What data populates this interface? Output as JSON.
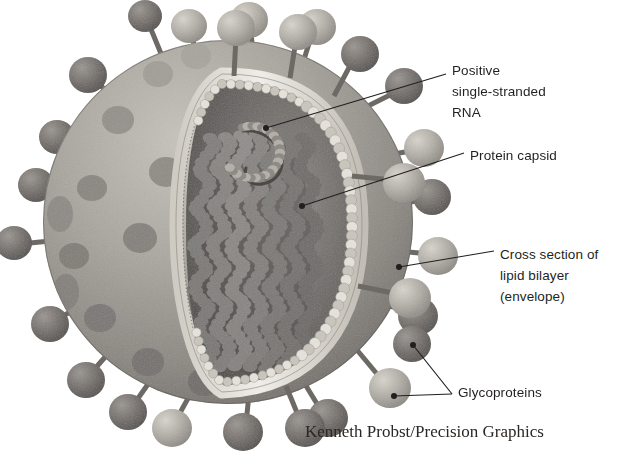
{
  "figure": {
    "credit": "Kenneth Probst/Precision Graphics",
    "background_color": "#ffffff",
    "ink_color": "#231f20"
  },
  "labels": [
    {
      "id": "rna",
      "text": "Positive\nsingle-stranded\nRNA",
      "lines": [
        "Positive",
        "single-stranded",
        "RNA"
      ],
      "text_x": 452,
      "text_y": 60,
      "leader": {
        "from_x": 266,
        "from_y": 128,
        "to_x": 446,
        "to_y": 74,
        "dot": true
      }
    },
    {
      "id": "protein-capsid",
      "text": "Protein capsid",
      "lines": [
        "Protein capsid"
      ],
      "text_x": 470,
      "text_y": 145,
      "leader": {
        "from_x": 302,
        "from_y": 206,
        "to_x": 464,
        "to_y": 153,
        "dot": true
      }
    },
    {
      "id": "lipid-bilayer",
      "text": "Cross section of\nlipid bilayer\n(envelope)",
      "lines": [
        "Cross section of",
        "lipid bilayer",
        "(envelope)"
      ],
      "text_x": 500,
      "text_y": 244,
      "leader": {
        "from_x": 399,
        "from_y": 267,
        "to_x": 494,
        "to_y": 251,
        "dot": true
      }
    },
    {
      "id": "glycoproteins",
      "text": "Glycoproteins",
      "lines": [
        "Glycoproteins"
      ],
      "text_x": 458,
      "text_y": 382,
      "leader": {
        "from_x": 413,
        "from_y": 345,
        "to_x": 452,
        "to_y": 394,
        "dot": true
      },
      "leader2": {
        "from_x": 394,
        "from_y": 396,
        "to_x": 452,
        "to_y": 394,
        "dot": true
      }
    }
  ],
  "structures": {
    "envelope_label": "lipid bilayer envelope",
    "capsid_label": "helical protein capsid",
    "genome_label": "positive single-stranded RNA",
    "spike_label": "glycoprotein spike"
  },
  "palette": {
    "membrane_light": "#b9b5ae",
    "membrane_mid": "#96928c",
    "membrane_dark": "#6e6a66",
    "bilayer_pale": "#e8e6e0",
    "bead_light": "#d6d2ca",
    "interior_dark": "#55514e",
    "interior_mid": "#7a7672",
    "capsid_dark": "#4a4744",
    "spike_light": "#b5b1aa",
    "spike_dark": "#6b6763"
  }
}
